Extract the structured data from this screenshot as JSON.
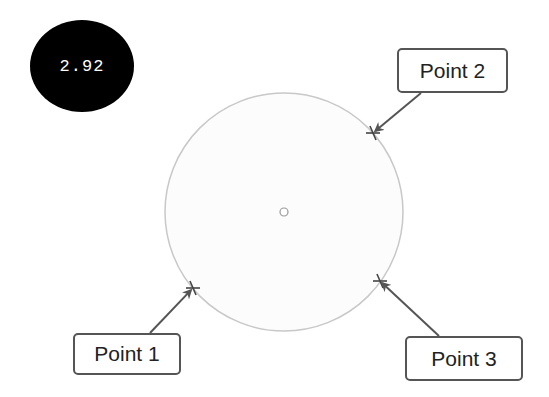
{
  "value_badge": {
    "text": "2.92",
    "background": "#000000",
    "color": "#ffffff"
  },
  "circle": {
    "cx": 284,
    "cy": 212,
    "r": 119,
    "stroke": "#c8c8c8",
    "fill": "#fcfcfc"
  },
  "center_marker": {
    "cx": 284,
    "cy": 212,
    "r": 4
  },
  "points": [
    {
      "label": "Point 1",
      "marker": [
        193,
        288
      ],
      "box": {
        "x": 73,
        "y": 333,
        "w": 108,
        "h": 42
      },
      "arrow_from": [
        150,
        333
      ]
    },
    {
      "label": "Point 2",
      "marker": [
        373,
        133
      ],
      "box": {
        "x": 397,
        "y": 48,
        "w": 111,
        "h": 45
      },
      "arrow_from": [
        421,
        93
      ]
    },
    {
      "label": "Point 3",
      "marker": [
        380,
        281
      ],
      "box": {
        "x": 405,
        "y": 336,
        "w": 118,
        "h": 45
      },
      "arrow_from": [
        439,
        336
      ]
    }
  ],
  "colors": {
    "arrow": "#555555",
    "marker": "#444444",
    "label_border": "#555555"
  }
}
